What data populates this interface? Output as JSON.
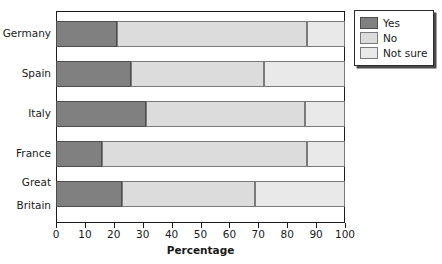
{
  "chart_data": {
    "type": "bar",
    "orientation": "horizontal",
    "stacked": true,
    "title": "",
    "xlabel": "Percentage",
    "ylabel": "",
    "xlim": [
      0,
      100
    ],
    "xticks": [
      0,
      10,
      20,
      30,
      40,
      50,
      60,
      70,
      80,
      90,
      100
    ],
    "xtick_labels": [
      "0",
      "10",
      "20",
      "30",
      "40",
      "50",
      "60",
      "70",
      "80",
      "90",
      "100"
    ],
    "grid": false,
    "legend_position": "top-right",
    "categories": [
      "Germany",
      "Spain",
      "Italy",
      "France",
      "Great\nBritain"
    ],
    "series": [
      {
        "name": "Yes",
        "color": "#808080",
        "values": [
          21,
          26,
          31,
          16,
          23
        ]
      },
      {
        "name": "No",
        "color": "#dcdcdc",
        "values": [
          66,
          46,
          55,
          71,
          46
        ]
      },
      {
        "name": "Not sure",
        "color": "#e9e9e9",
        "values": [
          13,
          28,
          14,
          13,
          31
        ]
      }
    ]
  },
  "axis": {
    "x_title": "Percentage",
    "ticks": [
      "0",
      "10",
      "20",
      "30",
      "40",
      "50",
      "60",
      "70",
      "80",
      "90",
      "100"
    ]
  },
  "categories": [
    {
      "label": "Germany"
    },
    {
      "label": "Spain"
    },
    {
      "label": "Italy"
    },
    {
      "label": "France"
    },
    {
      "label_line1": "Great",
      "label_line2": "Britain"
    }
  ],
  "legend": {
    "items": [
      {
        "label": "Yes",
        "color": "#808080"
      },
      {
        "label": "No",
        "color": "#dcdcdc"
      },
      {
        "label": "Not sure",
        "color": "#e9e9e9"
      }
    ]
  }
}
